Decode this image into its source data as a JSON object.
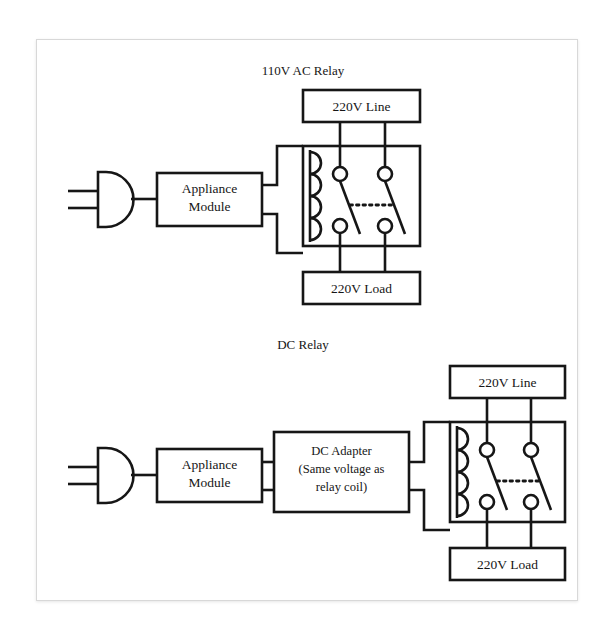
{
  "document": {
    "type": "circuit-diagram",
    "background_color": "#ffffff",
    "card_color": "#ffffff",
    "card_border_color": "#d8d8d8",
    "line_color": "#161616",
    "text_color": "#161616"
  },
  "diagrams": [
    {
      "id": "ac-relay",
      "title": "110V AC Relay",
      "blocks": {
        "plug": "plug-icon",
        "appliance_module": "Appliance\nModule",
        "appliance_module_line1": "Appliance",
        "appliance_module_line2": "Module",
        "line_source": "220V Line",
        "load": "220V Load"
      }
    },
    {
      "id": "dc-relay",
      "title": "DC Relay",
      "blocks": {
        "plug": "plug-icon",
        "appliance_module_line1": "Appliance",
        "appliance_module_line2": "Module",
        "dc_adapter_line1": "DC Adapter",
        "dc_adapter_line2": "(Same voltage as",
        "dc_adapter_line3": "relay coil)",
        "line_source": "220V Line",
        "load": "220V Load"
      }
    }
  ],
  "labels": {
    "ac_title": "110V AC Relay",
    "dc_title": "DC Relay",
    "appliance_1": "Appliance",
    "appliance_2": "Module",
    "dc_adapter_1": "DC Adapter",
    "dc_adapter_2": "(Same voltage as",
    "dc_adapter_3": "relay coil)",
    "line_top": "220V Line",
    "load_top": "220V Load",
    "line_bottom": "220V Line",
    "load_bottom": "220V Load"
  }
}
